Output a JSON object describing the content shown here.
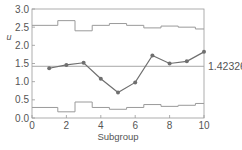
{
  "chart_data": {
    "type": "line",
    "title": "",
    "xlabel": "Subgroup",
    "ylabel": "u",
    "xlim": [
      0,
      10
    ],
    "ylim": [
      0.0,
      3.0
    ],
    "x_ticks": [
      "0",
      "2",
      "4",
      "6",
      "8",
      "10"
    ],
    "y_ticks": [
      "0.0",
      "0.5",
      "1.0",
      "1.5",
      "2.0",
      "2.5",
      "3.0"
    ],
    "grid": false,
    "center_line": {
      "value": 1.42326,
      "label": "1.42326"
    },
    "x": [
      1,
      2,
      3,
      4,
      5,
      6,
      7,
      8,
      9,
      10
    ],
    "series": [
      {
        "name": "u",
        "values": [
          1.37,
          1.46,
          1.52,
          1.08,
          0.7,
          0.98,
          1.72,
          1.5,
          1.56,
          1.82
        ]
      },
      {
        "name": "UCL",
        "values": [
          2.55,
          2.68,
          2.4,
          2.55,
          2.6,
          2.55,
          2.48,
          2.53,
          2.5,
          2.45
        ]
      },
      {
        "name": "LCL",
        "values": [
          0.29,
          0.17,
          0.44,
          0.29,
          0.24,
          0.29,
          0.37,
          0.32,
          0.35,
          0.4
        ]
      }
    ]
  },
  "colors": {
    "axis": "#999999",
    "data_line": "#6f6f6f",
    "limits": "#9a9a9a",
    "center": "#a8a8a8",
    "text": "#555555"
  }
}
